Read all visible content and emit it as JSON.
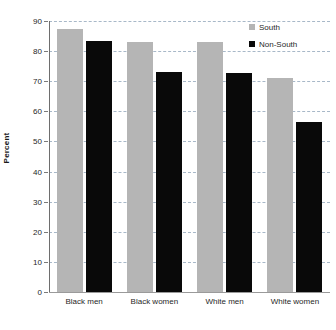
{
  "chart_data": {
    "type": "bar",
    "title": "",
    "subtitle": "",
    "xlabel": "",
    "ylabel": "Percent",
    "ylim": [
      0,
      90
    ],
    "ytick_step": 10,
    "yticks": [
      90,
      80,
      70,
      60,
      50,
      40,
      30,
      20,
      10,
      0
    ],
    "grid": true,
    "grid_axis": "y",
    "legend_position": "top-right",
    "categories": [
      "Black men",
      "Black women",
      "White men",
      "White women"
    ],
    "series": [
      {
        "name": "South",
        "color": "#b5b5b5",
        "values": [
          87.2,
          82.9,
          83.1,
          71.1
        ]
      },
      {
        "name": "Non-South",
        "color": "#090909",
        "values": [
          83.5,
          73.1,
          72.8,
          56.5
        ]
      }
    ]
  },
  "axis": {
    "y_title": "Percent"
  },
  "legend": {
    "items": [
      {
        "label": "South",
        "swatch_name": "legend-swatch-south"
      },
      {
        "label": "Non-South",
        "swatch_name": "legend-swatch-non-south"
      }
    ]
  }
}
